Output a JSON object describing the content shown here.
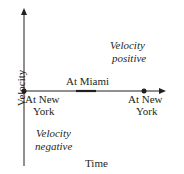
{
  "diagram": {
    "axes": {
      "x_label": "Time",
      "y_label": "Velocity"
    },
    "points": [
      {
        "label_line1": "At New",
        "label_line2": "York"
      },
      {
        "label": "At Miami"
      },
      {
        "label_line1": "At New",
        "label_line2": "York"
      }
    ],
    "regions": {
      "positive": {
        "line1": "Velocity",
        "line2": "positive"
      },
      "negative": {
        "line1": "Velocity",
        "line2": "negative"
      }
    },
    "colors": {
      "ink": "#231f20"
    }
  }
}
